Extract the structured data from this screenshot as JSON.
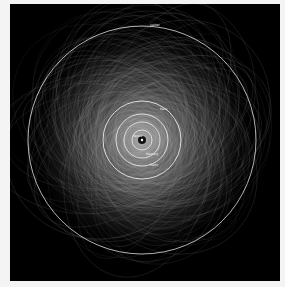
{
  "diagram": {
    "background": "#000000",
    "orbit_color": "#dddddd",
    "center": {
      "x": 142,
      "y": 140
    },
    "planets": [
      {
        "name": "Jupiter",
        "radius": 114,
        "label_x": 150,
        "label_y": 23
      },
      {
        "name": "Mars",
        "radius": 39,
        "label_x": 160,
        "label_y": 107
      },
      {
        "name": "Earth",
        "radius": 26,
        "label_x": 150,
        "label_y": 163
      },
      {
        "name": "Venus",
        "radius": 18,
        "label_x": 133,
        "label_y": 134
      },
      {
        "name": "Mercury",
        "radius": 10,
        "label_x": 146,
        "label_y": 152
      }
    ],
    "sun_label": "Sun"
  }
}
